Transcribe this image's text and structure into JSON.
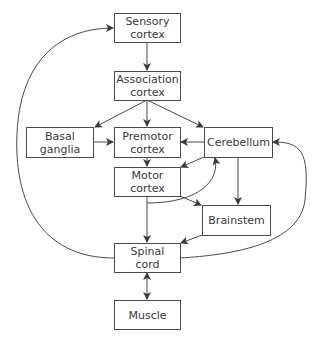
{
  "diagram": {
    "nodes": {
      "sensory": {
        "line1": "Sensory",
        "line2": "cortex"
      },
      "association": {
        "line1": "Association",
        "line2": "cortex"
      },
      "basal": {
        "line1": "Basal",
        "line2": "ganglia"
      },
      "premotor": {
        "line1": "Premotor",
        "line2": "cortex"
      },
      "cerebellum": {
        "line1": "Cerebellum"
      },
      "motor": {
        "line1": "Motor",
        "line2": "cortex"
      },
      "brainstem": {
        "line1": "Brainstem"
      },
      "spinal": {
        "line1": "Spinal",
        "line2": "cord"
      },
      "muscle": {
        "line1": "Muscle"
      }
    },
    "edges": [
      {
        "from": "Sensory cortex",
        "to": "Association cortex"
      },
      {
        "from": "Association cortex",
        "to": "Basal ganglia"
      },
      {
        "from": "Association cortex",
        "to": "Premotor cortex"
      },
      {
        "from": "Association cortex",
        "to": "Cerebellum"
      },
      {
        "from": "Basal ganglia",
        "to": "Premotor cortex"
      },
      {
        "from": "Cerebellum",
        "to": "Premotor cortex"
      },
      {
        "from": "Cerebellum",
        "to": "Motor cortex"
      },
      {
        "from": "Cerebellum",
        "to": "Brainstem"
      },
      {
        "from": "Premotor cortex",
        "to": "Motor cortex"
      },
      {
        "from": "Motor cortex",
        "to": "Cerebellum"
      },
      {
        "from": "Motor cortex",
        "to": "Brainstem"
      },
      {
        "from": "Motor cortex",
        "to": "Spinal cord"
      },
      {
        "from": "Brainstem",
        "to": "Spinal cord"
      },
      {
        "from": "Spinal cord",
        "to": "Sensory cortex"
      },
      {
        "from": "Spinal cord",
        "to": "Cerebellum"
      },
      {
        "from": "Spinal cord",
        "to": "Muscle",
        "bidirectional": true
      }
    ]
  }
}
